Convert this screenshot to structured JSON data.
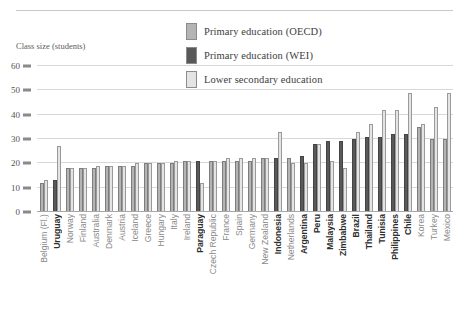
{
  "chart_data": {
    "type": "bar",
    "title": "",
    "xlabel": "",
    "ylabel": "Class size (students)",
    "ylim": [
      0,
      60
    ],
    "yticks": [
      0,
      10,
      20,
      30,
      40,
      50,
      60
    ],
    "grid": true,
    "legend_position": "top-center",
    "colors": {
      "oecd": "#b4b4b4",
      "wei": "#595959",
      "lower_secondary": "#e4e4e4"
    },
    "categories": [
      "Belgium (Fl.)",
      "Uruguay",
      "Norway",
      "Finland",
      "Australia",
      "Denmark",
      "Austria",
      "Iceland",
      "Greece",
      "Hungary",
      "Italy",
      "Ireland",
      "Paraguay",
      "Czech Republic",
      "France",
      "Spain",
      "Germany",
      "New Zealand",
      "Indonesia",
      "Netherlands",
      "Argentina",
      "Peru",
      "Malaysia",
      "Zimbabwe",
      "Brazil",
      "Thailand",
      "Tunisia",
      "Philippines",
      "Chile",
      "Korea",
      "Turkey",
      "Mexico"
    ],
    "wei_countries": [
      "Uruguay",
      "Paraguay",
      "Indonesia",
      "Argentina",
      "Peru",
      "Malaysia",
      "Zimbabwe",
      "Brazil",
      "Thailand",
      "Tunisia",
      "Philippines",
      "Chile"
    ],
    "series": [
      {
        "name": "Primary education (OECD)",
        "key": "oecd",
        "values": [
          12,
          null,
          18,
          18,
          18,
          19,
          19,
          19,
          20,
          20,
          20,
          21,
          null,
          21,
          21,
          21,
          21,
          22,
          null,
          22,
          null,
          null,
          null,
          null,
          null,
          null,
          null,
          null,
          null,
          35,
          30,
          30
        ]
      },
      {
        "name": "Primary education (WEI)",
        "key": "wei",
        "values": [
          null,
          13,
          null,
          null,
          null,
          null,
          null,
          null,
          null,
          null,
          null,
          null,
          21,
          null,
          null,
          null,
          null,
          null,
          22,
          null,
          23,
          28,
          29,
          29,
          30,
          31,
          31,
          32,
          32,
          null,
          null,
          null
        ]
      },
      {
        "name": "Lower secondary education",
        "key": "lower",
        "values": [
          13,
          27,
          18,
          18,
          19,
          19,
          19,
          20,
          20,
          20,
          21,
          21,
          12,
          21,
          22,
          22,
          22,
          22,
          33,
          20,
          20,
          28,
          21,
          18,
          33,
          36,
          42,
          42,
          49,
          36,
          43,
          49
        ]
      }
    ]
  },
  "legend": {
    "items": [
      {
        "label": "Primary education (OECD)",
        "key": "oecd"
      },
      {
        "label": "Primary education (WEI)",
        "key": "wei"
      },
      {
        "label": "Lower secondary education",
        "key": "lower"
      }
    ]
  }
}
